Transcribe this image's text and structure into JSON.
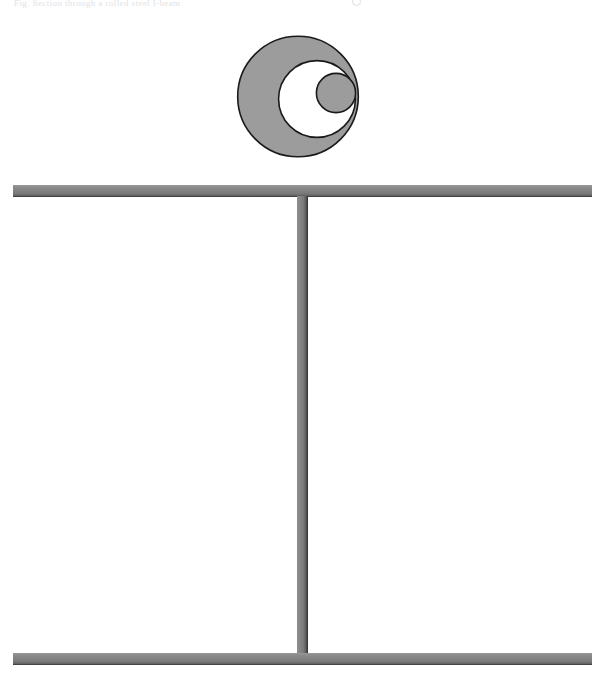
{
  "page": {
    "width": 604,
    "height": 686,
    "background_color": "#ffffff",
    "header_caption": "Fig.  Section through a rolled steel I-beam"
  },
  "figure": {
    "name": "circles-and-ibeam-diagram",
    "stroke_color": "#1a1a1a",
    "fill_gray": "#9c9c9c",
    "fill_white": "#ffffff"
  },
  "circles": {
    "label": "nested-tangent-circles",
    "items": [
      {
        "name": "outer-circle",
        "fill": "#9c9c9c",
        "stroke": "#1a1a1a",
        "cx": 298,
        "cy": 96.5,
        "r": 61
      },
      {
        "name": "middle-circle",
        "fill": "#ffffff",
        "stroke": "#1a1a1a",
        "cx": 317,
        "cy": 99,
        "r": 39
      },
      {
        "name": "inner-circle",
        "fill": "#9c9c9c",
        "stroke": "#1a1a1a",
        "cx": 336,
        "cy": 93,
        "r": 20
      }
    ]
  },
  "ibeam": {
    "label": "i-beam-cross-section",
    "color": "#808080",
    "edge_color": "#2b2b2b",
    "parts": [
      {
        "name": "top-flange",
        "x": 13,
        "y": 185,
        "width": 579,
        "height": 12
      },
      {
        "name": "web",
        "x": 297,
        "y": 196,
        "width": 11,
        "height": 458
      },
      {
        "name": "bottom-flange",
        "x": 13,
        "y": 653,
        "width": 579,
        "height": 12
      }
    ]
  }
}
